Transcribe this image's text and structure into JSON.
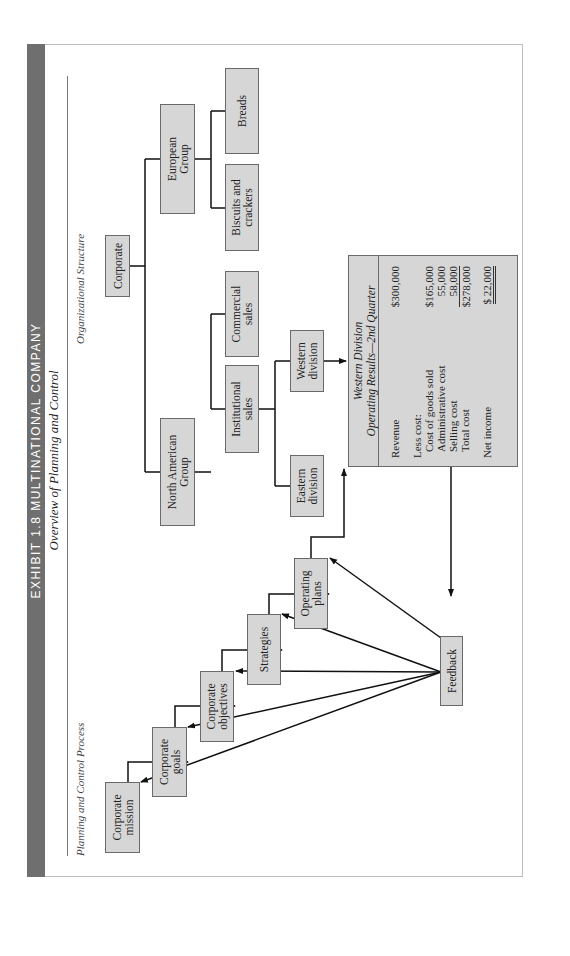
{
  "header": {
    "title": "EXHIBIT 1.8   MULTINATIONAL COMPANY",
    "subtitle": "Overview of Planning and Control"
  },
  "sections": {
    "left": "Planning and Control Process",
    "right": "Organizational Structure"
  },
  "planning_process": {
    "steps": [
      "Corporate\nmission",
      "Corporate\ngoals",
      "Corporate\nobjectives",
      "Strategies",
      "Operating\nplans"
    ],
    "feedback": "Feedback"
  },
  "org_structure": {
    "root": "Corporate",
    "groups": [
      "North American\nGroup",
      "European\nGroup"
    ],
    "north_american_units": [
      "Institutional\nsales",
      "Commercial\nsales"
    ],
    "european_units": [
      "Biscuits and\ncrackers",
      "Breads"
    ],
    "institutional_divisions": [
      "Eastern\ndivision",
      "Western\ndivision"
    ]
  },
  "report": {
    "title": "Western Division",
    "subtitle": "Operating Results—2nd Quarter",
    "revenue_label": "Revenue",
    "revenue_value": "$300,000",
    "less_cost_label": "Less cost:",
    "cogs_label": "Cost of goods sold",
    "cogs_value": "$165,000",
    "admin_label": "Administrative cost",
    "admin_value": "55,000",
    "selling_label": "Selling cost",
    "selling_value": "58,000",
    "total_label": "Total cost",
    "total_value": "$278,000",
    "net_label": "Net income",
    "net_value": "$  22,000"
  }
}
